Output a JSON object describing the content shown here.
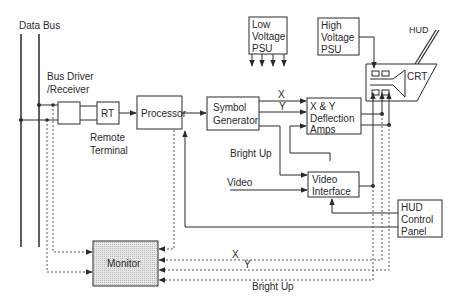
{
  "diagram": {
    "type": "block-diagram",
    "labels": {
      "data_bus": "Data Bus",
      "bus_driver_1": "Bus Driver",
      "bus_driver_2": "/Receiver",
      "rt": "RT",
      "remote_terminal_1": "Remote",
      "remote_terminal_2": "Terminal",
      "processor": "Processor",
      "symbol_gen_1": "Symbol",
      "symbol_gen_2": "Generator",
      "x": "X",
      "y": "Y",
      "deflection_1": "X & Y",
      "deflection_2": "Deflection",
      "deflection_3": "Amps",
      "bright_up": "Bright Up",
      "video": "Video",
      "video_if_1": "Video",
      "video_if_2": "Interface",
      "lv_psu_1": "Low",
      "lv_psu_2": "Voltage",
      "lv_psu_3": "PSU",
      "hv_psu_1": "High",
      "hv_psu_2": "Voltage",
      "hv_psu_3": "PSU",
      "hud": "HUD",
      "crt": "CRT",
      "hud_panel_1": "HUD",
      "hud_panel_2": "Control",
      "hud_panel_3": "Panel",
      "monitor": "Monitor",
      "monitor_x": "X",
      "monitor_y": "Y",
      "monitor_bright_up": "Bright Up"
    },
    "blocks": [
      "Bus Driver/Receiver",
      "RT (Remote Terminal)",
      "Processor",
      "Symbol Generator",
      "X & Y Deflection Amps",
      "Video Interface",
      "Low Voltage PSU",
      "High Voltage PSU",
      "CRT",
      "HUD Control Panel",
      "Monitor"
    ],
    "colors": {
      "line": "#2a2a2a",
      "monitor_fill": "#d8d8d8"
    }
  }
}
